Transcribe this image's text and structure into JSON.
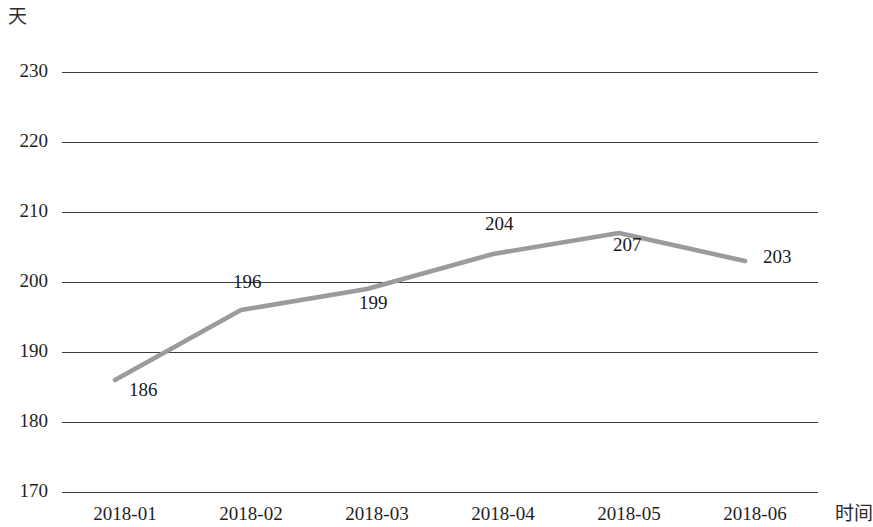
{
  "chart_data": {
    "type": "line",
    "title": "",
    "subtitle": "",
    "xlabel": "时间",
    "ylabel": "天",
    "categories": [
      "2018-01",
      "2018-02",
      "2018-03",
      "2018-04",
      "2018-05",
      "2018-06"
    ],
    "values": [
      186,
      196,
      199,
      204,
      207,
      203
    ],
    "point_labels": [
      "186",
      "196",
      "199",
      "204",
      "207",
      "203"
    ],
    "y_ticks": [
      230,
      220,
      210,
      200,
      190,
      180,
      170
    ],
    "y_tick_labels": [
      "230",
      "220",
      "210",
      "200",
      "190",
      "180",
      "170"
    ],
    "ylim": [
      170,
      230
    ],
    "grid": "horizontal",
    "legend": "none",
    "series_color": "#9b9b9b",
    "gridline_color": "#3c3c3c",
    "background_color": "#ffffff"
  },
  "axis": {
    "y_unit": "天",
    "x_unit": "时间"
  }
}
